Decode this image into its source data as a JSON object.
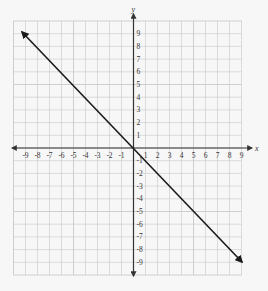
{
  "chart_data": {
    "type": "line",
    "title": "",
    "xlabel": "x",
    "ylabel": "y",
    "xlim": [
      -9,
      9
    ],
    "ylim": [
      -9,
      9
    ],
    "grid": true,
    "x_ticks": [
      -9,
      -8,
      -7,
      -6,
      -5,
      -4,
      -3,
      -2,
      -1,
      1,
      2,
      3,
      4,
      5,
      6,
      7,
      8,
      9
    ],
    "y_ticks": [
      9,
      8,
      7,
      6,
      5,
      4,
      3,
      2,
      1,
      -1,
      -2,
      -3,
      -4,
      -5,
      -6,
      -7,
      -8,
      -9
    ],
    "series": [
      {
        "name": "y = -x",
        "x": [
          -10,
          10
        ],
        "y": [
          10,
          -10
        ],
        "arrows": "both",
        "color": "#1a1a1a"
      }
    ],
    "legend": "none"
  },
  "colors": {
    "background": "#f7f7f7",
    "grid": "#c8c8c8",
    "axis": "#333333",
    "line": "#1a1a1a"
  }
}
